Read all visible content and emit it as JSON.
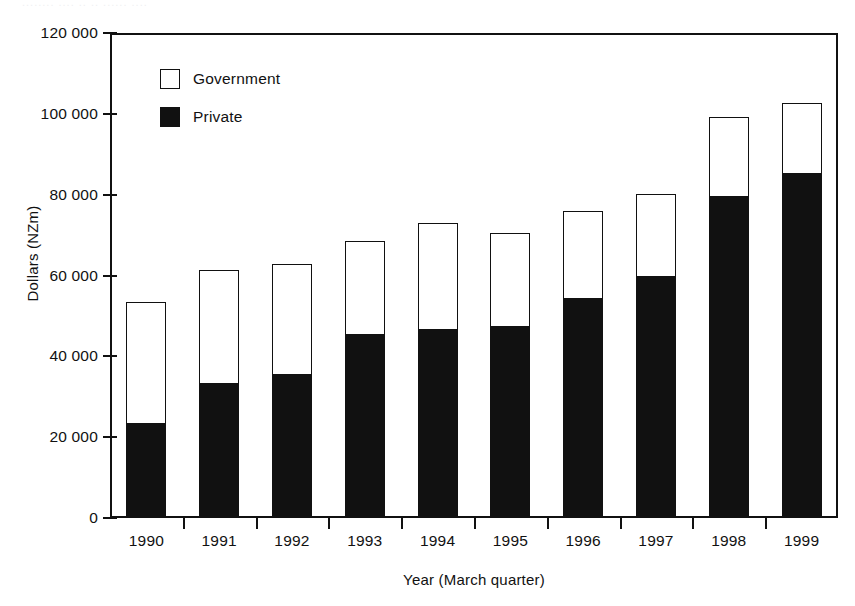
{
  "artifact_text": "........ ....  .. ..   ...... ....",
  "legend": {
    "position": "inside-top-left",
    "entries": [
      {
        "label": "Government",
        "swatch": "white",
        "color": "#ffffff"
      },
      {
        "label": "Private",
        "swatch": "black",
        "color": "#111111"
      }
    ]
  },
  "axes": {
    "y_title": "Dollars (NZm)",
    "x_title": "Year (March quarter)",
    "y_ticks": [
      "0",
      "20 000",
      "40 000",
      "60 000",
      "80 000",
      "100 000",
      "120 000"
    ],
    "y_tick_values": [
      0,
      20000,
      40000,
      60000,
      80000,
      100000,
      120000
    ]
  },
  "chart_data": {
    "type": "bar",
    "stacked": true,
    "title": "",
    "subtitle": "",
    "xlabel": "Year (March quarter)",
    "ylabel": "Dollars (NZm)",
    "ylim": [
      0,
      120000
    ],
    "ytick_step": 20000,
    "grid": false,
    "legend_position": "upper left (inside plot area)",
    "categories": [
      "1990",
      "1991",
      "1992",
      "1993",
      "1994",
      "1995",
      "1996",
      "1997",
      "1998",
      "1999"
    ],
    "series": [
      {
        "name": "Private",
        "color": "#111111",
        "values": [
          23300,
          33200,
          35400,
          45400,
          46600,
          47200,
          54300,
          59700,
          79500,
          85200
        ]
      },
      {
        "name": "Government",
        "color": "#ffffff",
        "values": [
          30100,
          28200,
          27500,
          23100,
          26500,
          23400,
          21600,
          20500,
          19800,
          17500
        ]
      }
    ],
    "totals": [
      53400,
      61400,
      62900,
      68500,
      73100,
      70600,
      75900,
      80200,
      99300,
      102700
    ],
    "units": "NZ$ million"
  }
}
